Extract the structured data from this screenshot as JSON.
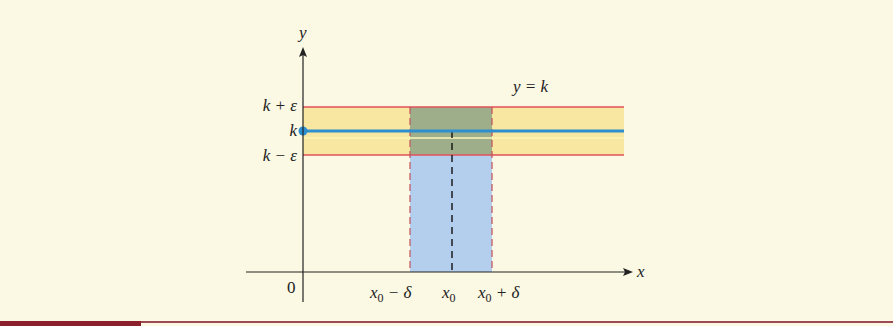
{
  "figure": {
    "type": "epsilon-delta limit of constant function",
    "colors": {
      "background": "#fbf8e3",
      "epsilon_band": "#f8e7a0",
      "delta_band": "#b4cfee",
      "overlap": "#9fae8a",
      "band_edges": "#e0505a",
      "function_line": "#2d8fd0",
      "axes": "#222222",
      "footer_bar": "#8b1f2b"
    },
    "labels": {
      "y_axis": "y",
      "x_axis": "x",
      "origin": "0",
      "k_plus_eps": "k + ε",
      "k": "k",
      "k_minus_eps": "k − ε",
      "curve": "y = k",
      "x0_minus_delta": {
        "base": "x",
        "sub": "0",
        "rest": " − δ"
      },
      "x0": {
        "base": "x",
        "sub": "0",
        "rest": ""
      },
      "x0_plus_delta": {
        "base": "x",
        "sub": "0",
        "rest": " + δ"
      }
    }
  }
}
